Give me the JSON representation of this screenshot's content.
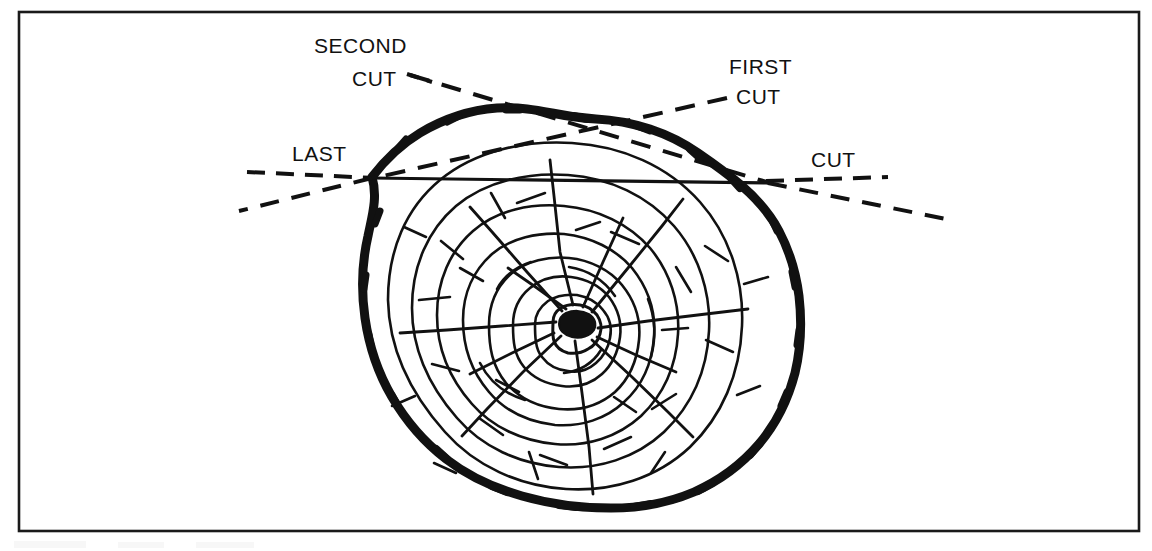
{
  "figure": {
    "background_color": "#ffffff",
    "ink_color": "#111111",
    "border": {
      "name": "figure-frame",
      "x": 18,
      "y": 11,
      "width": 1122,
      "height": 521,
      "stroke_width": 2.5,
      "color": "#1a1a1a"
    },
    "labels": [
      {
        "id": "second",
        "line1": "SECOND",
        "line2": "CUT",
        "x1": 314,
        "y1": 53,
        "x2": 352,
        "y2": 86
      },
      {
        "id": "first",
        "line1": "FIRST",
        "line2": "CUT",
        "x1": 729,
        "y1": 74,
        "x2": 736,
        "y2": 104
      },
      {
        "id": "last",
        "line1": "LAST",
        "x1": 292,
        "y1": 161
      },
      {
        "id": "cut",
        "line1": "CUT",
        "x1": 811,
        "y1": 167
      }
    ],
    "log": {
      "name": "log-cross-section",
      "bark_color": "#111111",
      "center_pith": {
        "cx": 578,
        "cy": 322,
        "rx": 13,
        "ry": 7
      },
      "description": "Irregular bark-outlined log end with concentric growth rings and radial checks"
    },
    "cut_lines": {
      "last_cut": {
        "style": "solid",
        "from_x": 372,
        "from_y": 178,
        "to_x": 768,
        "to_y": 182
      },
      "first_cut": {
        "style": "dashed",
        "label_anchor": "upper-right"
      },
      "second_cut": {
        "style": "dashed",
        "label_anchor": "upper-left"
      }
    }
  }
}
